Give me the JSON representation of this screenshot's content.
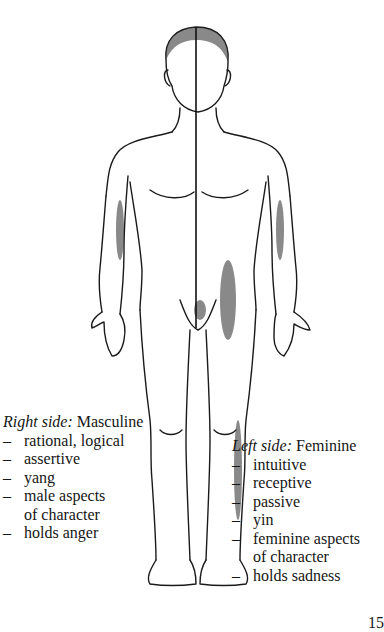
{
  "figure": {
    "divider_line": "vertical-centre-line"
  },
  "right_side": {
    "label_italic": "Right side:",
    "label_plain": "Masculine",
    "items": [
      "rational, logical",
      "assertive",
      "yang",
      "male aspects",
      "of character",
      "holds anger"
    ],
    "item_dashes": [
      "–",
      "–",
      "–",
      "–",
      "",
      "–"
    ]
  },
  "left_side": {
    "label_italic": "Left side:",
    "label_plain": "Feminine",
    "items": [
      "intuitive",
      "receptive",
      "passive",
      "yin",
      "feminine aspects",
      "of character",
      "holds sadness"
    ],
    "item_dashes": [
      "–",
      "–",
      "–",
      "–",
      "–",
      "",
      "–"
    ]
  },
  "page_number": "15"
}
